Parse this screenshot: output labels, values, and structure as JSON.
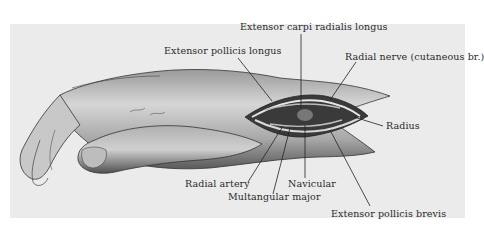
{
  "figure": {
    "background_color": "#ebebeb",
    "labels": [
      {
        "id": "ecrl",
        "text": "Extensor carpi radialis longus"
      },
      {
        "id": "epl",
        "text": "Extensor pollicis longus"
      },
      {
        "id": "radial_nerve",
        "text": "Radial nerve (cutaneous br.)"
      },
      {
        "id": "radius",
        "text": "Radius"
      },
      {
        "id": "radial_artery",
        "text": "Radial artery"
      },
      {
        "id": "navicular",
        "text": "Navicular"
      },
      {
        "id": "multangular",
        "text": "Multangular major"
      },
      {
        "id": "epb",
        "text": "Extensor pollicis brevis"
      }
    ]
  }
}
